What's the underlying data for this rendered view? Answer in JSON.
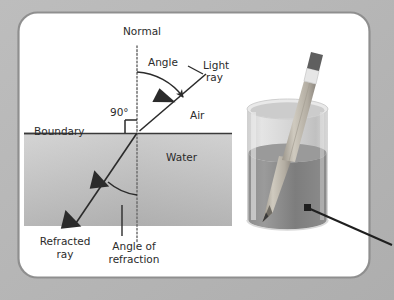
{
  "figure": {
    "title_alt": "Refraction of light at an air-water boundary",
    "background_color": "#b6b6b6",
    "card_color": "#ffffff",
    "card_border_color": "#8d8d8d",
    "water_color_top": "#d3d3d3",
    "water_color_bottom": "#a9a9a9",
    "ink_color": "#2b2b2b"
  },
  "labels": {
    "normal": "Normal",
    "angle": "Angle",
    "light_ray_line1": "Light",
    "light_ray_line2": "ray",
    "air": "Air",
    "water": "Water",
    "boundary": "Boundary",
    "right_angle": "90°",
    "refracted_line1": "Refracted",
    "refracted_line2": "ray",
    "angle_of_refraction_line1": "Angle of",
    "angle_of_refraction_line2": "refraction"
  },
  "geometry": {
    "card": {
      "x": 18,
      "y": 12,
      "width": 352,
      "height": 266,
      "radius": 20
    },
    "water_rect": {
      "x": 24,
      "y": 134,
      "width": 208,
      "height": 92
    },
    "boundary_line": {
      "x1": 24,
      "y1": 133,
      "x2": 232,
      "y2": 133
    },
    "normal_line": {
      "x": 137,
      "y1": 46,
      "y2": 243,
      "style": "dotted"
    },
    "incidence_point": {
      "x": 137,
      "y": 133
    },
    "incident_ray": {
      "x1": 206,
      "y1": 74,
      "x2": 137,
      "y2": 133
    },
    "refracted_ray": {
      "x1": 137,
      "y1": 133,
      "x2": 74,
      "y2": 226
    },
    "right_angle_marker": {
      "x": 122,
      "y": 118,
      "size": 11
    },
    "angle_of_incidence_deg": 50,
    "angle_of_refraction_deg": 34
  },
  "beaker": {
    "left": 247,
    "right": 328,
    "rim_y": 108,
    "bottom_y": 227,
    "water_level_y": 152,
    "glass_color": "#d8d8d8",
    "liquid_color": "#8a8a8a"
  },
  "pencil": {
    "tip_x": 266,
    "tip_y": 227,
    "top_x": 323,
    "top_y": 56,
    "body_color": "#b9b5ac",
    "eraser_color": "#5f5f5f",
    "ferrule_color": "#e3e3e3"
  },
  "pointer": {
    "from_x": 307,
    "from_y": 208,
    "to_x": 392,
    "to_y": 245,
    "color": "#1f1f1f"
  }
}
